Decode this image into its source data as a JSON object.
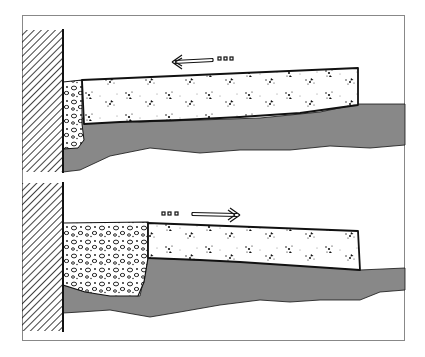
{
  "diagram": {
    "frame": {
      "x": 22,
      "y": 15,
      "width": 383,
      "height": 326,
      "stroke": "#888888"
    },
    "colors": {
      "ink": "#111111",
      "paper": "#ffffff",
      "frame": "#888888"
    },
    "panels": [
      {
        "id": "top",
        "description": "Slab pushed toward wall; gravel strip compressed",
        "wall": {
          "x": 22,
          "y": 30,
          "width": 41,
          "height": 142
        },
        "gravel": {
          "x1": 63,
          "x2": 82,
          "top": 80,
          "bottom": 148
        },
        "slab": {
          "left": 82,
          "right": 358,
          "top_left": 80,
          "top_right": 68,
          "bottom_left": 122,
          "bottom_right": 105
        },
        "ground_right_level": 105,
        "arrow": {
          "direction": "left",
          "x_tail": 230,
          "x_head": 172,
          "y": 62,
          "icon": "arrow-left-icon"
        }
      },
      {
        "id": "bottom",
        "description": "Slab pulled away from wall; gravel fills gap",
        "wall": {
          "x": 22,
          "y": 183,
          "width": 41,
          "height": 148
        },
        "gravel": {
          "x1": 63,
          "x2": 148,
          "top": 222,
          "bottom": 296
        },
        "slab": {
          "left": 148,
          "right": 360,
          "top_left": 223,
          "top_right": 230,
          "bottom_left": 258,
          "bottom_right": 270
        },
        "ground_right_level": 268,
        "arrow": {
          "direction": "right",
          "x_tail": 162,
          "x_head": 240,
          "y": 214,
          "icon": "arrow-right-icon"
        }
      }
    ]
  }
}
